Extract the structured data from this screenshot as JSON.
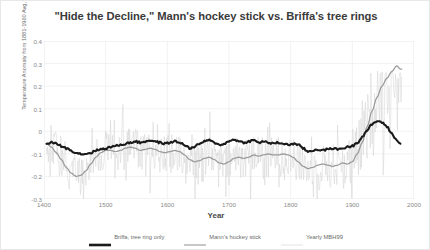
{
  "chart_data": {
    "type": "line",
    "title": "\"Hide the Decline,\" Mann's hockey stick vs. Briffa's tree rings",
    "xlabel": "Year",
    "ylabel": "Temperature Anomaly from 1881-1960 Avg, °C",
    "xlim": [
      1400,
      2000
    ],
    "ylim": [
      -0.3,
      0.4
    ],
    "xticks": [
      "1400",
      "1500",
      "1600",
      "1700",
      "1800",
      "1900",
      "2000"
    ],
    "xtick_values": [
      1400,
      1500,
      1600,
      1700,
      1800,
      1900,
      2000
    ],
    "yticks": [
      "0.4",
      "0.3",
      "0.2",
      "0.1",
      "0",
      "-0.1",
      "-0.2",
      "-0.3"
    ],
    "ytick_values": [
      0.4,
      0.3,
      0.2,
      0.1,
      0,
      -0.1,
      -0.2,
      -0.3
    ],
    "grid": true,
    "legend_position": "bottom",
    "colors": {
      "briffa": "#1a1a1a",
      "mann": "#9a9a9a",
      "yearly": "#d2d2d2",
      "grid": "#ececec",
      "text": "#6d6d6d"
    },
    "series": [
      {
        "name": "Briffa, tree ring only",
        "color": "#1a1a1a",
        "width": 2.1,
        "x": [
          1404,
          1412,
          1420,
          1428,
          1436,
          1444,
          1452,
          1460,
          1468,
          1476,
          1484,
          1492,
          1500,
          1508,
          1516,
          1524,
          1532,
          1540,
          1548,
          1556,
          1564,
          1572,
          1580,
          1588,
          1596,
          1604,
          1612,
          1620,
          1628,
          1636,
          1644,
          1652,
          1660,
          1668,
          1676,
          1684,
          1692,
          1700,
          1708,
          1716,
          1724,
          1732,
          1740,
          1748,
          1756,
          1764,
          1772,
          1780,
          1788,
          1796,
          1804,
          1812,
          1820,
          1828,
          1836,
          1844,
          1852,
          1860,
          1868,
          1876,
          1884,
          1892,
          1900,
          1908,
          1916,
          1924,
          1932,
          1940,
          1948,
          1956,
          1964,
          1972,
          1978
        ],
        "y": [
          -0.055,
          -0.05,
          -0.055,
          -0.065,
          -0.075,
          -0.085,
          -0.095,
          -0.1,
          -0.1,
          -0.095,
          -0.085,
          -0.08,
          -0.075,
          -0.07,
          -0.065,
          -0.06,
          -0.055,
          -0.05,
          -0.045,
          -0.05,
          -0.045,
          -0.04,
          -0.045,
          -0.05,
          -0.055,
          -0.05,
          -0.045,
          -0.05,
          -0.06,
          -0.075,
          -0.07,
          -0.055,
          -0.045,
          -0.04,
          -0.05,
          -0.06,
          -0.055,
          -0.045,
          -0.035,
          -0.045,
          -0.05,
          -0.045,
          -0.04,
          -0.05,
          -0.045,
          -0.05,
          -0.055,
          -0.05,
          -0.055,
          -0.06,
          -0.055,
          -0.06,
          -0.075,
          -0.09,
          -0.085,
          -0.08,
          -0.085,
          -0.08,
          -0.075,
          -0.08,
          -0.075,
          -0.07,
          -0.065,
          -0.05,
          -0.025,
          0.005,
          0.03,
          0.045,
          0.04,
          0.02,
          -0.01,
          -0.04,
          -0.055
        ]
      },
      {
        "name": "Mann's hockey stick",
        "color": "#9a9a9a",
        "width": 1.25,
        "x": [
          1404,
          1412,
          1420,
          1428,
          1436,
          1444,
          1452,
          1460,
          1468,
          1476,
          1484,
          1492,
          1500,
          1508,
          1516,
          1524,
          1532,
          1540,
          1548,
          1556,
          1564,
          1572,
          1580,
          1588,
          1596,
          1604,
          1612,
          1620,
          1628,
          1636,
          1644,
          1652,
          1660,
          1668,
          1676,
          1684,
          1692,
          1700,
          1708,
          1716,
          1724,
          1732,
          1740,
          1748,
          1756,
          1764,
          1772,
          1780,
          1788,
          1796,
          1804,
          1812,
          1820,
          1828,
          1836,
          1844,
          1852,
          1860,
          1868,
          1876,
          1884,
          1892,
          1900,
          1908,
          1916,
          1924,
          1932,
          1940,
          1948,
          1956,
          1964,
          1972,
          1978
        ],
        "y": [
          -0.055,
          -0.07,
          -0.095,
          -0.125,
          -0.16,
          -0.185,
          -0.2,
          -0.195,
          -0.175,
          -0.145,
          -0.115,
          -0.095,
          -0.085,
          -0.085,
          -0.09,
          -0.085,
          -0.075,
          -0.07,
          -0.075,
          -0.085,
          -0.08,
          -0.075,
          -0.08,
          -0.09,
          -0.095,
          -0.09,
          -0.085,
          -0.09,
          -0.105,
          -0.125,
          -0.135,
          -0.13,
          -0.12,
          -0.115,
          -0.125,
          -0.14,
          -0.145,
          -0.135,
          -0.12,
          -0.115,
          -0.12,
          -0.115,
          -0.105,
          -0.11,
          -0.105,
          -0.1,
          -0.105,
          -0.105,
          -0.1,
          -0.105,
          -0.115,
          -0.135,
          -0.155,
          -0.165,
          -0.16,
          -0.15,
          -0.145,
          -0.15,
          -0.155,
          -0.15,
          -0.14,
          -0.145,
          -0.135,
          -0.1,
          -0.05,
          0.02,
          0.09,
          0.15,
          0.2,
          0.235,
          0.265,
          0.29,
          0.275
        ]
      },
      {
        "name": "Yearly MBH99",
        "color": "#d2d2d2",
        "width": 0.5,
        "noise_envelope": [
          -0.31,
          0.27
        ],
        "description": "annual resolution noisy series oscillating about Mann's smoothed curve"
      }
    ]
  },
  "legend": {
    "entries": [
      {
        "label": "Briffa, tree ring only",
        "color": "#1a1a1a",
        "width": 2.6
      },
      {
        "label": "Mann's hockey stick",
        "color": "#9a9a9a",
        "width": 1.1
      },
      {
        "label": "Yearly MBH99",
        "color": "#dcdcdc",
        "width": 0.8
      }
    ]
  }
}
